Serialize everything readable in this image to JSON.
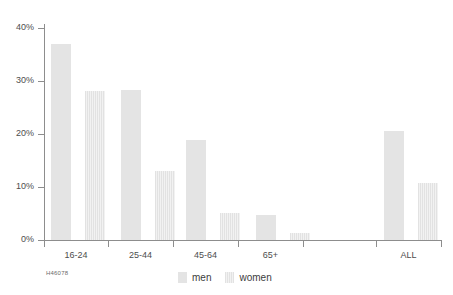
{
  "chart_data": {
    "type": "bar",
    "title": "",
    "subtitle": "",
    "xlabel": "",
    "ylabel": "",
    "categories": [
      "16-24",
      "25-44",
      "45-64",
      "65+",
      "ALL"
    ],
    "series": [
      {
        "name": "men",
        "values": [
          37.0,
          28.3,
          18.8,
          4.8,
          20.6
        ]
      },
      {
        "name": "women",
        "values": [
          28.2,
          13.1,
          5.1,
          1.3,
          10.8
        ]
      }
    ],
    "ylim": [
      0,
      40
    ],
    "y_ticks": [
      0,
      10,
      20,
      30,
      40
    ],
    "y_tick_labels": [
      "0%",
      "10%",
      "20%",
      "30%",
      "40%"
    ],
    "grid": false,
    "legend_position": "bottom-center",
    "legend_entries": [
      "men",
      "women"
    ],
    "colors": {
      "men": "#e4e4e4",
      "women": "#ededed",
      "axis": "#8d8d8d",
      "text": "#4d4d4d",
      "background": "#ffffff"
    }
  },
  "footer": {
    "code": "H46078"
  },
  "legend": {
    "men_label": "men",
    "women_label": "women"
  }
}
